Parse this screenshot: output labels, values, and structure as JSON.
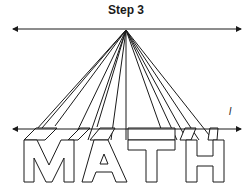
{
  "title": "Step 3",
  "line_label": "l",
  "word": "MATH",
  "colors": {
    "ink": "#1a1a1a",
    "background": "#ffffff"
  },
  "horizon_line": {
    "y": 29,
    "x_start": 12,
    "x_end": 242
  },
  "ground_line": {
    "y": 129,
    "x_start": 12,
    "x_end": 242
  },
  "vanishing_point": {
    "x": 126,
    "y": 30
  }
}
